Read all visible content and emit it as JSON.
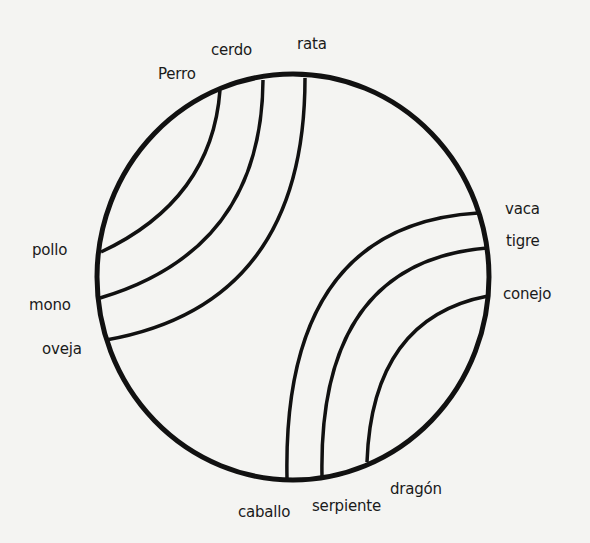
{
  "diagram": {
    "type": "circle-divided-by-arcs",
    "stroke_color": "#111111",
    "background_color": "#f4f4f2",
    "circle": {
      "cx": 293,
      "cy": 277,
      "rx": 196,
      "ry": 203
    },
    "labels": {
      "perro": "Perro",
      "cerdo": "cerdo",
      "rata": "rata",
      "pollo": "pollo",
      "mono": "mono",
      "oveja": "oveja",
      "vaca": "vaca",
      "tigre": "tigre",
      "conejo": "conejo",
      "caballo": "caballo",
      "serpiente": "serpiente",
      "dragon": "dragón"
    },
    "connections": [
      {
        "from": "Perro",
        "to": "pollo"
      },
      {
        "from": "cerdo",
        "to": "mono"
      },
      {
        "from": "rata",
        "to": "oveja"
      },
      {
        "from": "vaca",
        "to": "caballo"
      },
      {
        "from": "tigre",
        "to": "serpiente"
      },
      {
        "from": "conejo",
        "to": "dragón"
      }
    ]
  }
}
